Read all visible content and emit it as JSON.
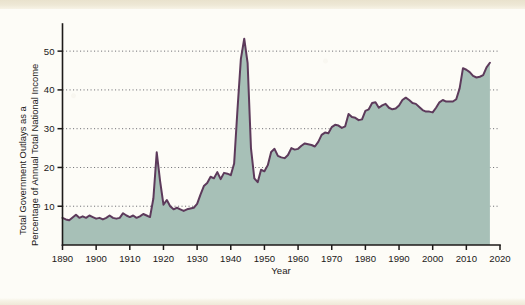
{
  "figure": {
    "background_color": "#fdfcf7",
    "page_edge_color": "#eee8d6"
  },
  "chart_data": {
    "type": "area",
    "title": "",
    "subtitle": "",
    "xlabel": "Year",
    "ylabel": "Total Government Outlays as a Percentage of Annual Total National Income",
    "ylabel_line1": "Total Government Outlays as a",
    "ylabel_line2": "Percentage of Annual Total National Income",
    "xlim": [
      1890,
      2020
    ],
    "ylim": [
      0,
      57
    ],
    "xticks": [
      1890,
      1900,
      1910,
      1920,
      1930,
      1940,
      1950,
      1960,
      1970,
      1980,
      1990,
      2000,
      2010,
      2020
    ],
    "xtick_labels": [
      "1890",
      "1900",
      "1910",
      "1920",
      "1930",
      "1940",
      "1950",
      "1960",
      "1970",
      "1980",
      "1990",
      "2000",
      "2010",
      "2020"
    ],
    "yticks": [
      10,
      20,
      30,
      40,
      50
    ],
    "ytick_labels": [
      "10",
      "20",
      "30",
      "40",
      "50"
    ],
    "grid": true,
    "grid_orientation": "horizontal",
    "grid_style": "dotted",
    "legend": false,
    "legend_position": "none",
    "line_color": "#5d3a5b",
    "fill_color": "#a7c0b7",
    "series": [
      {
        "name": "Total Government Outlays",
        "x": [
          1890,
          1891,
          1892,
          1893,
          1894,
          1895,
          1896,
          1897,
          1898,
          1899,
          1900,
          1901,
          1902,
          1903,
          1904,
          1905,
          1906,
          1907,
          1908,
          1909,
          1910,
          1911,
          1912,
          1913,
          1914,
          1915,
          1916,
          1917,
          1918,
          1919,
          1920,
          1921,
          1922,
          1923,
          1924,
          1925,
          1926,
          1927,
          1928,
          1929,
          1930,
          1931,
          1932,
          1933,
          1934,
          1935,
          1936,
          1937,
          1938,
          1939,
          1940,
          1941,
          1942,
          1943,
          1944,
          1945,
          1946,
          1947,
          1948,
          1949,
          1950,
          1951,
          1952,
          1953,
          1954,
          1955,
          1956,
          1957,
          1958,
          1959,
          1960,
          1961,
          1962,
          1963,
          1964,
          1965,
          1966,
          1967,
          1968,
          1969,
          1970,
          1971,
          1972,
          1973,
          1974,
          1975,
          1976,
          1977,
          1978,
          1979,
          1980,
          1981,
          1982,
          1983,
          1984,
          1985,
          1986,
          1987,
          1988,
          1989,
          1990,
          1991,
          1992,
          1993,
          1994,
          1995,
          1996,
          1997,
          1998,
          1999,
          2000,
          2001,
          2002,
          2003,
          2004,
          2005,
          2006,
          2007,
          2008,
          2009,
          2010,
          2011,
          2012,
          2013,
          2014,
          2015,
          2016,
          2017
        ],
        "values": [
          7.0,
          6.6,
          6.4,
          7.1,
          7.8,
          7.0,
          7.4,
          7.0,
          7.6,
          7.2,
          6.8,
          7.0,
          6.6,
          7.0,
          7.6,
          7.0,
          6.8,
          7.0,
          8.2,
          7.6,
          7.2,
          7.6,
          7.0,
          7.4,
          8.0,
          7.6,
          7.2,
          12.0,
          23.9,
          16.5,
          10.4,
          11.6,
          10.0,
          9.2,
          9.6,
          9.2,
          8.8,
          9.2,
          9.4,
          9.6,
          10.6,
          13.0,
          15.2,
          16.0,
          17.6,
          17.2,
          18.8,
          17.0,
          18.6,
          18.4,
          18.0,
          21.0,
          35.0,
          48.0,
          53.2,
          47.0,
          25.0,
          17.2,
          16.2,
          19.4,
          19.0,
          20.6,
          24.0,
          24.8,
          23.0,
          22.6,
          22.4,
          23.2,
          25.0,
          24.6,
          24.8,
          25.6,
          26.2,
          26.0,
          25.8,
          25.4,
          26.6,
          28.4,
          29.0,
          28.8,
          30.4,
          31.0,
          30.8,
          30.2,
          30.6,
          33.8,
          33.0,
          32.8,
          32.2,
          32.4,
          34.6,
          35.0,
          36.6,
          36.8,
          35.4,
          36.0,
          36.4,
          35.4,
          35.0,
          35.2,
          36.0,
          37.4,
          38.0,
          37.4,
          36.6,
          36.4,
          35.6,
          34.8,
          34.4,
          34.4,
          34.2,
          35.4,
          36.8,
          37.4,
          37.0,
          37.0,
          37.0,
          37.6,
          40.4,
          45.6,
          45.2,
          44.6,
          43.6,
          43.2,
          43.4,
          43.8,
          45.8,
          47.0
        ]
      }
    ],
    "annotations": [
      {
        "label": "World War I peak",
        "x": 1918,
        "y": 23.9
      },
      {
        "label": "World War II peak",
        "x": 1944,
        "y": 53.2
      },
      {
        "label": "Post-war trough",
        "x": 1948,
        "y": 16.2
      },
      {
        "label": "Great Recession rise",
        "x": 2009,
        "y": 45.6
      }
    ]
  }
}
